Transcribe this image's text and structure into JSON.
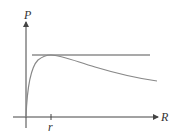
{
  "diagram": {
    "type": "function-plot",
    "axes": {
      "y_label": "P",
      "x_label": "R",
      "tick_label": "r"
    },
    "colors": {
      "axes": "#444444",
      "curve": "#888888",
      "asymptote": "#555555",
      "background": "#ffffff"
    },
    "elements": [
      {
        "name": "horizontal-line",
        "description": "horizontal line tangent to curve maximum"
      },
      {
        "name": "curve",
        "description": "rises steeply from origin, peaks at R=r, then decays slowly"
      }
    ]
  }
}
